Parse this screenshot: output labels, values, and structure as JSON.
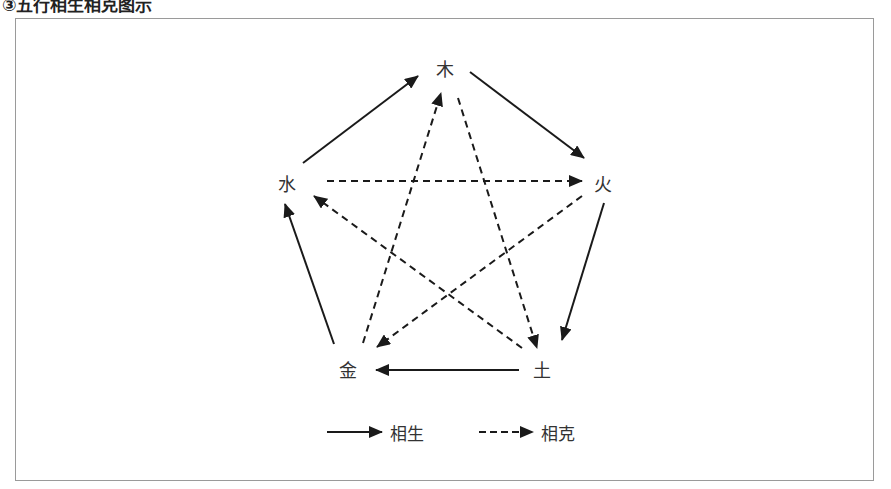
{
  "title": "③五行相生相克图示",
  "diagram": {
    "nodes": [
      {
        "id": "wood",
        "label": "木",
        "x": 445,
        "y": 68
      },
      {
        "id": "fire",
        "label": "火",
        "x": 603,
        "y": 183
      },
      {
        "id": "earth",
        "label": "土",
        "x": 542,
        "y": 369
      },
      {
        "id": "metal",
        "label": "金",
        "x": 348,
        "y": 369
      },
      {
        "id": "water",
        "label": "水",
        "x": 287,
        "y": 183
      }
    ],
    "generating_cycle": [
      {
        "from": "木",
        "to": "火"
      },
      {
        "from": "火",
        "to": "土"
      },
      {
        "from": "土",
        "to": "金"
      },
      {
        "from": "金",
        "to": "水"
      },
      {
        "from": "水",
        "to": "木"
      }
    ],
    "overcoming_cycle": [
      {
        "from": "木",
        "to": "土"
      },
      {
        "from": "土",
        "to": "水"
      },
      {
        "from": "水",
        "to": "火"
      },
      {
        "from": "火",
        "to": "金"
      },
      {
        "from": "金",
        "to": "木"
      }
    ],
    "colors": {
      "line": "#1a1a1a",
      "text": "#333333",
      "frame": "#9a9a9a"
    }
  },
  "legend": {
    "generating_label": "相生",
    "overcoming_label": "相克"
  }
}
